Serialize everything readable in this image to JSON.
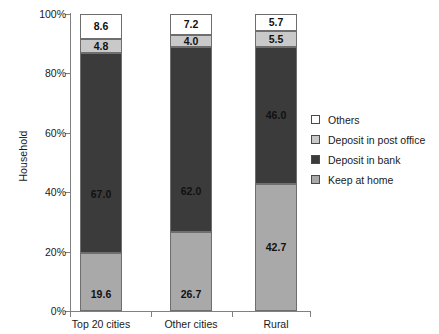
{
  "chart_data": {
    "type": "bar",
    "stacked": true,
    "title": "",
    "xlabel": "",
    "ylabel": "Household",
    "ylim": [
      0,
      100
    ],
    "ytick_labels": [
      "0%",
      "20%",
      "40%",
      "60%",
      "80%",
      "100%"
    ],
    "ytick_values": [
      0,
      20,
      40,
      60,
      80,
      100
    ],
    "grid": false,
    "legend_position": "right",
    "categories": [
      "Top 20 cities",
      "Other cities",
      "Rural"
    ],
    "series": [
      {
        "name": "Keep at home",
        "color": "#a9a9a9",
        "values": [
          19.6,
          26.7,
          42.7
        ],
        "labels": [
          "19.6",
          "26.7",
          "42.7"
        ]
      },
      {
        "name": "Deposit in bank",
        "color": "#3b3b3b",
        "values": [
          67.0,
          62.0,
          46.0
        ],
        "labels": [
          "67.0",
          "62.0",
          "46.0"
        ]
      },
      {
        "name": "Deposit in post office",
        "color": "#c9c9c9",
        "values": [
          4.8,
          4.0,
          5.5
        ],
        "labels": [
          "4.8",
          "4.0",
          "5.5"
        ]
      },
      {
        "name": "Others",
        "color": "#ffffff",
        "values": [
          8.6,
          7.2,
          5.7
        ],
        "labels": [
          "8.6",
          "7.2",
          "5.7"
        ]
      }
    ],
    "legend_entries": [
      {
        "label": "Others",
        "color": "#ffffff"
      },
      {
        "label": "Deposit in post office",
        "color": "#c9c9c9"
      },
      {
        "label": "Deposit in bank",
        "color": "#3b3b3b"
      },
      {
        "label": "Keep at home",
        "color": "#a9a9a9"
      }
    ]
  }
}
